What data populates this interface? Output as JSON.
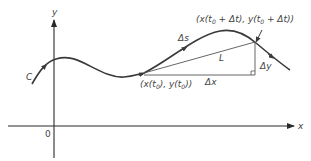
{
  "figure": {
    "colors": {
      "curve": "#3a3a3a",
      "axes": "#2a2a2a",
      "chord": "#555555",
      "text": "#444444"
    },
    "axes": {
      "x_label": "x",
      "y_label": "y",
      "origin_label": "0"
    },
    "curve": {
      "label": "C"
    },
    "points": {
      "start": {
        "label_prefix": "(x(t",
        "sub": "0",
        "mid": "), y(t",
        "sub2": "0",
        "suffix": "))"
      },
      "end": {
        "label_prefix": "(x(t",
        "sub": "0",
        "mid": " + Δt), y(t",
        "sub2": "0",
        "suffix": " + Δt))"
      }
    },
    "annotations": {
      "arc": "Δs",
      "chord": "L",
      "dx": "Δx",
      "dy": "Δy"
    }
  }
}
